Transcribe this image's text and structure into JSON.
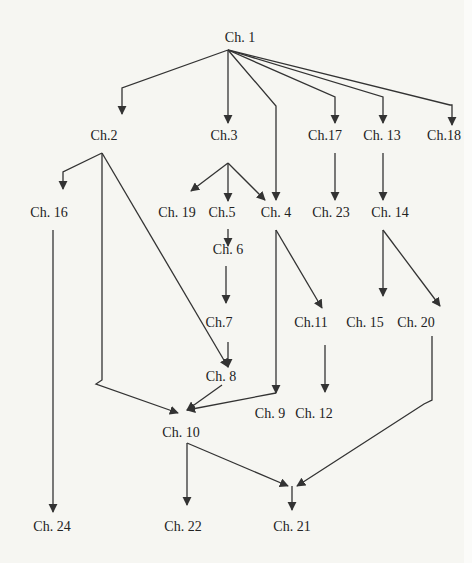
{
  "diagram": {
    "type": "chapter dependency graph",
    "colors": {
      "background": "#f6f6f2",
      "ink": "#333333"
    },
    "nodes": [
      {
        "id": "ch1",
        "label": "Ch. 1",
        "x": 240,
        "y": 38
      },
      {
        "id": "ch2",
        "label": "Ch.2",
        "x": 104,
        "y": 136
      },
      {
        "id": "ch3",
        "label": "Ch.3",
        "x": 224,
        "y": 136
      },
      {
        "id": "ch17",
        "label": "Ch.17",
        "x": 325,
        "y": 136
      },
      {
        "id": "ch13",
        "label": "Ch. 13",
        "x": 382,
        "y": 136
      },
      {
        "id": "ch18",
        "label": "Ch.18",
        "x": 444,
        "y": 136
      },
      {
        "id": "ch16",
        "label": "Ch. 16",
        "x": 49,
        "y": 213
      },
      {
        "id": "ch19",
        "label": "Ch. 19",
        "x": 177,
        "y": 213
      },
      {
        "id": "ch5",
        "label": "Ch.5",
        "x": 222,
        "y": 213
      },
      {
        "id": "ch4",
        "label": "Ch. 4",
        "x": 276,
        "y": 213
      },
      {
        "id": "ch23",
        "label": "Ch. 23",
        "x": 331,
        "y": 213
      },
      {
        "id": "ch14",
        "label": "Ch. 14",
        "x": 390,
        "y": 213
      },
      {
        "id": "ch6",
        "label": "Ch.  6",
        "x": 228,
        "y": 250
      },
      {
        "id": "ch7",
        "label": "Ch.7",
        "x": 219,
        "y": 323
      },
      {
        "id": "ch11",
        "label": "Ch.11",
        "x": 311,
        "y": 323
      },
      {
        "id": "ch15",
        "label": "Ch. 15",
        "x": 365,
        "y": 323
      },
      {
        "id": "ch20",
        "label": "Ch. 20",
        "x": 416,
        "y": 323
      },
      {
        "id": "ch8",
        "label": "Ch. 8",
        "x": 221,
        "y": 377
      },
      {
        "id": "ch9",
        "label": "Ch. 9",
        "x": 270,
        "y": 414
      },
      {
        "id": "ch12",
        "label": "Ch. 12",
        "x": 314,
        "y": 414
      },
      {
        "id": "ch10",
        "label": "Ch. 10",
        "x": 181,
        "y": 433
      },
      {
        "id": "ch24",
        "label": "Ch. 24",
        "x": 52,
        "y": 527
      },
      {
        "id": "ch22",
        "label": "Ch. 22",
        "x": 183,
        "y": 527
      },
      {
        "id": "ch21",
        "label": "Ch. 21",
        "x": 292,
        "y": 527
      }
    ],
    "edges": [
      {
        "from": "ch1",
        "to": "ch2",
        "path": "M228,50 L122,88 L122,114"
      },
      {
        "from": "ch1",
        "to": "ch3",
        "path": "M228,50 L228,123"
      },
      {
        "from": "ch1",
        "to": "ch4",
        "path": "M228,50 L276,106 L276,200"
      },
      {
        "from": "ch1",
        "to": "ch17",
        "path": "M228,50 L335,97 L335,123"
      },
      {
        "from": "ch1",
        "to": "ch13",
        "path": "M228,50 L383,97 L383,123"
      },
      {
        "from": "ch1",
        "to": "ch18",
        "path": "M228,50 L450,105 L452,105 L452,125"
      },
      {
        "from": "ch2",
        "to": "ch16",
        "path": "M102,153 L63,172 L63,189"
      },
      {
        "from": "ch2",
        "to": "ch10",
        "path": "M102,153 L102,380 L96,384 L178,413"
      },
      {
        "from": "ch2",
        "to": "ch8",
        "path": "M102,153 L228,367"
      },
      {
        "from": "ch3",
        "to": "ch19",
        "path": "M228,163 L191,191"
      },
      {
        "from": "ch3",
        "to": "ch5",
        "path": "M228,163 L228,201"
      },
      {
        "from": "ch3",
        "to": "ch4",
        "path": "M228,163 L265,200"
      },
      {
        "from": "ch17",
        "to": "ch23",
        "path": "M335,153 L335,200"
      },
      {
        "from": "ch13",
        "to": "ch14",
        "path": "M383,153 L383,200"
      },
      {
        "from": "ch16",
        "to": "ch24",
        "path": "M53,230 L53,512"
      },
      {
        "from": "ch5",
        "to": "ch6",
        "path": "M228,229 L228,246"
      },
      {
        "from": "ch4",
        "to": "ch9",
        "path": "M276,230 L276,393"
      },
      {
        "from": "ch4",
        "to": "ch11",
        "path": "M276,230 L322,308"
      },
      {
        "from": "ch14",
        "to": "ch15",
        "path": "M383,230 L383,296"
      },
      {
        "from": "ch14",
        "to": "ch20",
        "path": "M383,230 L440,306"
      },
      {
        "from": "ch6",
        "to": "ch7",
        "path": "M226,266 L226,303"
      },
      {
        "from": "ch7",
        "to": "ch8",
        "path": "M228,342 L228,367"
      },
      {
        "from": "ch11",
        "to": "ch12",
        "path": "M325,345 L325,392"
      },
      {
        "from": "ch8",
        "to": "ch10",
        "path": "M222,385 L187,410"
      },
      {
        "from": "ch9",
        "to": "ch10",
        "path": "M276,393 L187,410"
      },
      {
        "from": "ch20",
        "to": "ch21",
        "path": "M432,336 L432,400 L424,404 L297,486"
      },
      {
        "from": "ch10",
        "to": "ch22",
        "path": "M187,443 L187,505"
      },
      {
        "from": "ch10",
        "to": "ch21",
        "path": "M187,443 L288,486"
      },
      {
        "from": "ch21-merge",
        "to": "ch21",
        "path": "M292,486 L292,510"
      }
    ]
  }
}
